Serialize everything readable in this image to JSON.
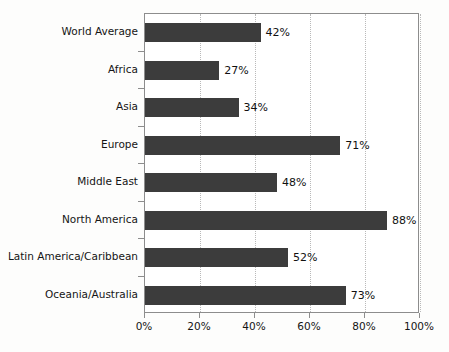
{
  "chart_data": {
    "type": "bar",
    "orientation": "horizontal",
    "title": "",
    "subtitle": "",
    "xlabel": "",
    "ylabel": "",
    "xlim": [
      0,
      100
    ],
    "grid": true,
    "legend": "none",
    "categories": [
      "World Average",
      "Africa",
      "Asia",
      "Europe",
      "Middle East",
      "North America",
      "Latin America/Caribbean",
      "Oceania/Australia"
    ],
    "values": [
      42,
      27,
      34,
      71,
      48,
      88,
      52,
      73
    ],
    "value_labels": [
      "42%",
      "27%",
      "34%",
      "71%",
      "48%",
      "88%",
      "52%",
      "73%"
    ],
    "xticks": [
      0,
      20,
      40,
      60,
      80,
      100
    ],
    "xtick_labels": [
      "0%",
      "20%",
      "40%",
      "60%",
      "80%",
      "100%"
    ],
    "colors": {
      "bar": "#3c3c3c",
      "axis": "#8d8d8d",
      "gridline": "#b9b9b9",
      "text": "#151515",
      "plot_background": "#ffffff",
      "page_background": "#fdfdfc"
    }
  }
}
